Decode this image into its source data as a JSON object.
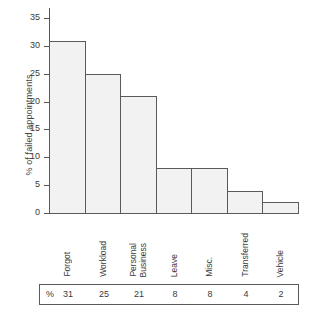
{
  "chart_data": {
    "type": "bar",
    "title": "",
    "xlabel": "",
    "ylabel": "% of failed appointments",
    "categories": [
      "Forgot",
      "Workload",
      "Personal Business",
      "Leave",
      "Misc.",
      "Transferred",
      "Vehicle"
    ],
    "category_lines": [
      [
        "Forgot"
      ],
      [
        "Workload"
      ],
      [
        "Personal",
        "Business"
      ],
      [
        "Leave"
      ],
      [
        "Misc."
      ],
      [
        "Transferred"
      ],
      [
        "Vehicle"
      ]
    ],
    "values": [
      30.8,
      25.0,
      21.0,
      8.0,
      8.0,
      4.0,
      2.0
    ],
    "ylim": [
      0,
      35
    ],
    "yticks": [
      0,
      5,
      10,
      15,
      20,
      25,
      30,
      35
    ],
    "ytick_labels": [
      "0",
      "5",
      "10",
      "15",
      "20",
      "25",
      "30",
      "35"
    ],
    "grid": false,
    "legend": "none",
    "bar_fill_color": "#f2f2f2",
    "bar_edge_color": "#5a5a5a",
    "axis_color": "#555555"
  },
  "data_table": {
    "row_label": "%",
    "values": [
      "31",
      "25",
      "21",
      "8",
      "8",
      "4",
      "2"
    ]
  }
}
